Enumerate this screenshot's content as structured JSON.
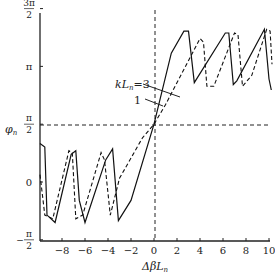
{
  "chart_data": {
    "type": "line",
    "title": "",
    "xlabel": "ΔβL_n",
    "ylabel": "φ_n",
    "xlim": [
      -10,
      10
    ],
    "ylim_labels": [
      "-π/2",
      "0",
      "π/2",
      "π",
      "3π/2"
    ],
    "ylim": [
      -1.5708,
      4.7124
    ],
    "x_ticks": [
      -8,
      -6,
      -4,
      -2,
      0,
      2,
      4,
      6,
      8,
      10
    ],
    "y_ticks": [
      {
        "label_num": "",
        "label_den": "2",
        "label_pre": "−",
        "label_top": "π",
        "value": -1.5708
      },
      {
        "label": "0",
        "value": 0
      },
      {
        "label_top": "π",
        "label_den": "2",
        "value": 1.5708
      },
      {
        "label": "π",
        "value": 3.1416
      },
      {
        "label_top": "3π",
        "label_den": "2",
        "value": 4.7124
      }
    ],
    "reference_lines": {
      "horizontal": "π/2",
      "vertical": 0,
      "style": "dashed"
    },
    "grid": false,
    "legend": [
      {
        "label": "kL_n=3",
        "style": "solid"
      },
      {
        "label": "1",
        "style": "dashed"
      }
    ],
    "series": [
      {
        "name": "kL_n=3",
        "style": "solid",
        "x": [
          -10,
          -9.5,
          -9.3,
          -8.6,
          -7.2,
          -6.8,
          -6.5,
          -6.0,
          -4.2,
          -3.6,
          -3.1,
          -2,
          0,
          1.5,
          2.6,
          3.0,
          3.5,
          6.2,
          6.5,
          6.9,
          7.2,
          9.6,
          10.0,
          10.2
        ],
        "y": [
          1.05,
          0.95,
          -0.9,
          -1.1,
          0.75,
          0.85,
          -0.5,
          -1.1,
          0.6,
          0.9,
          -1.05,
          -0.5,
          1.5708,
          3.5,
          4.1,
          4.1,
          2.7,
          4.05,
          4.05,
          2.65,
          2.75,
          4.15,
          2.8,
          2.5
        ],
        "color": "#111111"
      },
      {
        "name": "kL_n=1",
        "style": "dashed",
        "x": [
          -10,
          -9.5,
          -8.8,
          -7.4,
          -7.1,
          -6.8,
          -6.2,
          -4.6,
          -4.3,
          -3.8,
          -3,
          -1,
          0,
          1,
          2.5,
          4.0,
          4.3,
          4.6,
          5.2,
          7.0,
          7.3,
          7.7,
          8.5,
          9.8,
          10.1,
          10.3
        ],
        "y": [
          0.2,
          -0.9,
          -1.0,
          0.85,
          0.8,
          -1.0,
          -0.9,
          0.8,
          0.6,
          -0.9,
          0.1,
          1.2,
          1.5708,
          2.1,
          3.0,
          3.9,
          3.8,
          2.6,
          2.6,
          4.05,
          4.0,
          2.6,
          2.9,
          4.15,
          4.1,
          3.2
        ],
        "color": "#111111"
      }
    ]
  },
  "axes": {
    "x_label": "ΔβL",
    "x_label_sub": "n",
    "y_label": "φ",
    "y_label_sub": "n"
  },
  "annotations": {
    "k3_label": "kL",
    "k3_sub": "n",
    "k3_value": "=3",
    "k1_label": "1"
  }
}
